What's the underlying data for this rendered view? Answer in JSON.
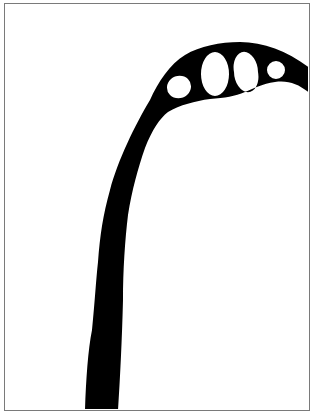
{
  "figure": {
    "colors": {
      "shape": "#000000",
      "background": "#ffffff",
      "border": "#7a7a7a"
    }
  }
}
